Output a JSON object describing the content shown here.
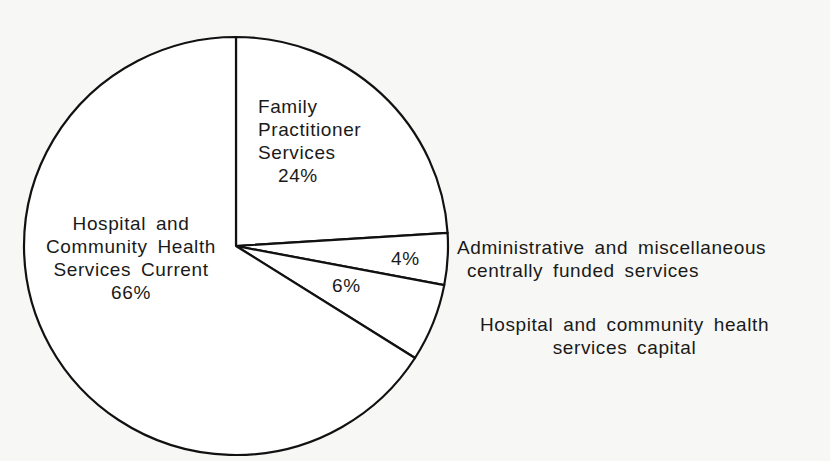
{
  "chart_data": {
    "type": "pie",
    "title": "",
    "start_angle_deg": 90,
    "direction": "clockwise",
    "slices": [
      {
        "label": "Family Practitioner Services",
        "value": 24,
        "value_label": "24%"
      },
      {
        "label": "Administrative and miscellaneous centrally funded services",
        "value": 4,
        "value_label": "4%"
      },
      {
        "label": "Hospital and community health services capital",
        "value": 6,
        "value_label": "6%"
      },
      {
        "label": "Hospital and Community Health Services Current",
        "value": 66,
        "value_label": "66%"
      }
    ],
    "unit": "%",
    "colors": {
      "fill": "#ffffff",
      "stroke": "#111111",
      "background": "#f7f7f5"
    }
  },
  "labels": {
    "fps": [
      "Family",
      "Practitioner",
      "Services",
      "24%"
    ],
    "hchs_current": [
      "Hospital and",
      "Community Health",
      "Services Current",
      "66%"
    ],
    "admin_pct": "4%",
    "capital_pct": "6%",
    "admin_text": [
      "Administrative and miscellaneous",
      "centrally funded services"
    ],
    "capital_text": [
      "Hospital and community health",
      "services capital"
    ]
  }
}
